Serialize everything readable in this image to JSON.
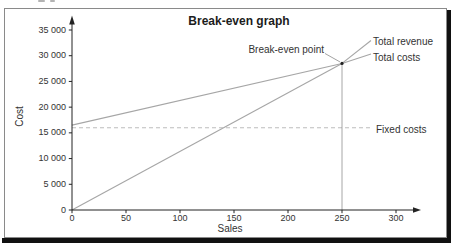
{
  "window": {
    "background": "#ffffff"
  },
  "frame": {
    "border_color": "#8a8a8a",
    "shadow_color": "#111111"
  },
  "axis_color": "#222222",
  "text_color": "#2f2f2f",
  "chart_data": {
    "type": "line",
    "title": "Break-even graph",
    "xlabel": "Sales",
    "ylabel": "Cost",
    "xlim": [
      0,
      320
    ],
    "ylim": [
      0,
      36000
    ],
    "grid": false,
    "legend_position": "direct labels at right end of each line",
    "x_ticks": {
      "values": [
        0,
        50,
        100,
        150,
        200,
        250,
        300
      ],
      "labels": [
        "0",
        "50",
        "100",
        "150",
        "200",
        "250",
        "300"
      ]
    },
    "y_ticks": {
      "values": [
        0,
        5000,
        10000,
        15000,
        20000,
        25000,
        30000,
        35000
      ],
      "labels": [
        "0",
        "5 000",
        "10 000",
        "15 000",
        "20 000",
        "25 000",
        "30 000",
        "35 000"
      ]
    },
    "series": [
      {
        "name": "Total revenue",
        "style": "solid",
        "color": "#a6a6a6",
        "points": [
          [
            0,
            0
          ],
          [
            250,
            28500
          ]
        ]
      },
      {
        "name": "Total costs",
        "style": "solid",
        "color": "#a6a6a6",
        "points": [
          [
            0,
            16500
          ],
          [
            250,
            28500
          ]
        ]
      },
      {
        "name": "Fixed costs",
        "style": "dashed",
        "color": "#bdbdbd",
        "points": [
          [
            0,
            16000
          ],
          [
            278,
            16000
          ]
        ]
      }
    ],
    "annotations": [
      {
        "label": "Break-even point",
        "x": 250,
        "y": 28500,
        "note": "marked dot at intersection of total revenue and total costs; vertical reference line drops to the x-axis at 250"
      }
    ]
  }
}
